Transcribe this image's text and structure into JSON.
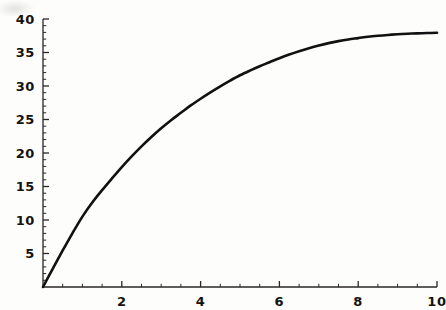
{
  "figure": {
    "background_color": "#fdfdfc",
    "ink_color": "#14120f",
    "axis_color": "#2a2724",
    "curve_color": "#111111"
  },
  "chart_data": {
    "type": "line",
    "title": "",
    "subtitle": "",
    "xlabel": "",
    "ylabel": "",
    "xlim": [
      0,
      10
    ],
    "ylim": [
      0,
      40
    ],
    "grid": false,
    "legend": false,
    "legend_position": "none",
    "x_ticks_major": [
      2,
      4,
      6,
      8,
      10
    ],
    "x_tick_labels": [
      "2",
      "4",
      "6",
      "8",
      "10"
    ],
    "x_minor_tick_interval": 0.5,
    "y_ticks_major": [
      5,
      10,
      15,
      20,
      25,
      30,
      35,
      40
    ],
    "y_tick_labels": [
      "5",
      "10",
      "15",
      "20",
      "25",
      "30",
      "35",
      "40"
    ],
    "y_minor_tick_interval": 1,
    "y_axis_origin_label_shown": false,
    "x_axis_origin_label_shown": false,
    "series": [
      {
        "name": "saturating-growth",
        "style": "solid",
        "line_width": 2.6,
        "color": "#111111",
        "x": [
          0,
          0.25,
          0.5,
          0.75,
          1,
          1.25,
          1.5,
          1.75,
          2,
          2.25,
          2.5,
          2.75,
          3,
          3.25,
          3.5,
          3.75,
          4,
          4.25,
          4.5,
          4.75,
          5,
          5.25,
          5.5,
          5.75,
          6,
          6.25,
          6.5,
          6.75,
          7,
          7.25,
          7.5,
          7.75,
          8,
          8.25,
          8.5,
          8.75,
          9,
          9.25,
          9.5,
          9.75,
          10
        ],
        "y": [
          0,
          2.75,
          5.45,
          8.05,
          10.5,
          12.6,
          14.45,
          16.2,
          17.9,
          19.5,
          21.0,
          22.4,
          23.7,
          24.9,
          26.0,
          27.1,
          28.1,
          29.05,
          29.95,
          30.8,
          31.6,
          32.3,
          32.95,
          33.55,
          34.15,
          34.7,
          35.2,
          35.65,
          36.05,
          36.4,
          36.7,
          36.95,
          37.15,
          37.35,
          37.5,
          37.62,
          37.72,
          37.8,
          37.86,
          37.9,
          37.95
        ]
      }
    ]
  },
  "axes_geometry": {
    "origin_px": {
      "x": 43,
      "y": 287
    },
    "x_end_px": 437,
    "y_top_px": 19,
    "px_per_x_unit": 39.4,
    "px_per_y_unit": 6.7
  }
}
